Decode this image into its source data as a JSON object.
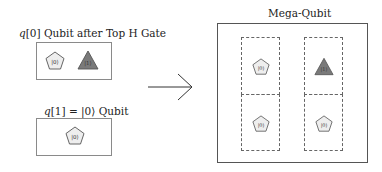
{
  "left_panel": {
    "top": {
      "title_var": "q",
      "title_rest": "[0] Qubit after Top H Gate",
      "shapes": [
        {
          "type": "pentagon",
          "label": "|0⟩",
          "fill": "#eeeeee",
          "stroke": "#555555"
        },
        {
          "type": "triangle",
          "label": "|1⟩",
          "fill": "#7a7a7a",
          "stroke": "#555555"
        }
      ]
    },
    "bottom": {
      "title_var": "q",
      "title_rest": "[1] = |0⟩ Qubit",
      "shapes": [
        {
          "type": "pentagon",
          "label": "|0⟩",
          "fill": "#eeeeee",
          "stroke": "#555555"
        }
      ]
    }
  },
  "arrow": {
    "direction": "right",
    "color": "#333333"
  },
  "right_panel": {
    "title": "Mega-Qubit",
    "cells": [
      {
        "row": 0,
        "col": 0,
        "shape": "pentagon",
        "label": "|0⟩",
        "fill": "#eeeeee"
      },
      {
        "row": 0,
        "col": 1,
        "shape": "triangle",
        "label": "|1⟩",
        "fill": "#7a7a7a"
      },
      {
        "row": 1,
        "col": 0,
        "shape": "pentagon",
        "label": "|0⟩",
        "fill": "#eeeeee"
      },
      {
        "row": 1,
        "col": 1,
        "shape": "pentagon",
        "label": "|0⟩",
        "fill": "#eeeeee"
      }
    ]
  }
}
